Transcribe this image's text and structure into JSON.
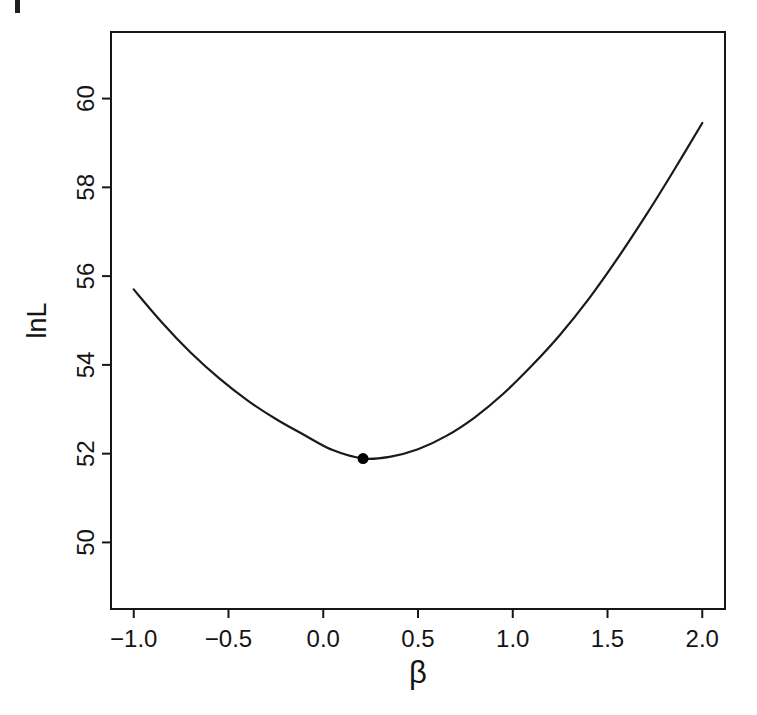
{
  "figure": {
    "background": "#ffffff",
    "ink_color": "#1a1a1a"
  },
  "chart_data": {
    "type": "line",
    "title": "",
    "xlabel": "β",
    "ylabel": "lnL",
    "xlim": [
      -1.12,
      2.12
    ],
    "ylim": [
      48.5,
      61.5
    ],
    "grid": false,
    "legend": false,
    "x_ticks": {
      "values": [
        -1.0,
        -0.5,
        0.0,
        0.5,
        1.0,
        1.5,
        2.0
      ],
      "labels": [
        "−1.0",
        "−0.5",
        "0.0",
        "0.5",
        "1.0",
        "1.5",
        "2.0"
      ]
    },
    "y_ticks": {
      "values": [
        50,
        52,
        54,
        56,
        58,
        60
      ],
      "labels": [
        "50",
        "52",
        "54",
        "56",
        "58",
        "60"
      ]
    },
    "series": [
      {
        "name": "log-likelihood-curve",
        "color": "#1a1a1a",
        "points": [
          [
            -1.0,
            55.7
          ],
          [
            -0.85,
            54.95
          ],
          [
            -0.7,
            54.28
          ],
          [
            -0.55,
            53.7
          ],
          [
            -0.4,
            53.2
          ],
          [
            -0.25,
            52.78
          ],
          [
            -0.1,
            52.42
          ],
          [
            0.05,
            52.08
          ],
          [
            0.21,
            51.89
          ],
          [
            0.35,
            51.93
          ],
          [
            0.5,
            52.1
          ],
          [
            0.65,
            52.4
          ],
          [
            0.8,
            52.82
          ],
          [
            0.95,
            53.35
          ],
          [
            1.1,
            53.98
          ],
          [
            1.25,
            54.68
          ],
          [
            1.4,
            55.48
          ],
          [
            1.55,
            56.38
          ],
          [
            1.7,
            57.35
          ],
          [
            1.85,
            58.38
          ],
          [
            2.0,
            59.45
          ]
        ]
      }
    ],
    "markers": [
      {
        "name": "minimum-point",
        "x": 0.21,
        "y": 51.89,
        "shape": "filled-circle",
        "color": "#000000"
      }
    ]
  }
}
